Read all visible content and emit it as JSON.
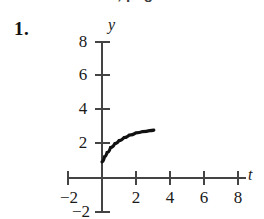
{
  "page": {
    "background_color": "#ffffff",
    "width": 264,
    "height": 219,
    "running_header": "Exercise 4.1, page 5"
  },
  "problem": {
    "number_label": "1."
  },
  "chart_data": {
    "type": "line",
    "title": "",
    "xlabel": "t",
    "ylabel": "y",
    "xlim": [
      -3,
      8.6
    ],
    "ylim": [
      -2.3,
      8.6
    ],
    "grid": false,
    "legend": null,
    "x_ticks": [
      -2,
      2,
      4,
      6,
      8
    ],
    "x_tick_labels": [
      "−2",
      "2",
      "4",
      "6",
      "8"
    ],
    "y_ticks": [
      8,
      6,
      4,
      2,
      -2
    ],
    "y_tick_labels": [
      "8",
      "6",
      "4",
      "2",
      "−2"
    ],
    "curve_color": "#111111",
    "axis_color": "#444444",
    "series": [
      {
        "name": "y(t)",
        "description": "increasing concave-down curve rising from about (0, 1) to about (3, 2.8)",
        "x": [
          0.0,
          0.15,
          0.3,
          0.5,
          0.75,
          1.0,
          1.3,
          1.6,
          2.0,
          2.4,
          2.8,
          3.05
        ],
        "y": [
          0.95,
          1.25,
          1.5,
          1.78,
          2.02,
          2.2,
          2.38,
          2.52,
          2.65,
          2.73,
          2.79,
          2.82
        ]
      }
    ]
  },
  "axis_labels": {
    "x_name": "t",
    "y_name": "y"
  }
}
